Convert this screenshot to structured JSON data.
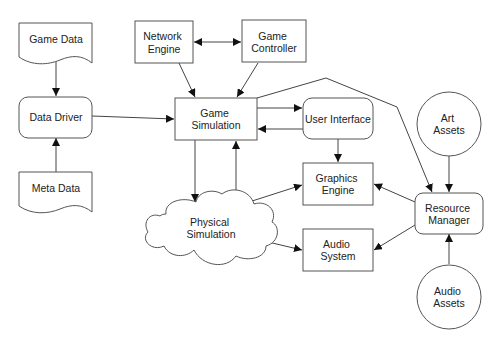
{
  "diagram": {
    "type": "game engine architecture flowchart",
    "nodes": {
      "game_data": {
        "label": [
          "Game Data"
        ],
        "shape": "document"
      },
      "data_driver": {
        "label": [
          "Data Driver"
        ],
        "shape": "rounded-rect"
      },
      "meta_data": {
        "label": [
          "Meta Data"
        ],
        "shape": "document"
      },
      "network_engine": {
        "label": [
          "Network",
          "Engine"
        ],
        "shape": "rect"
      },
      "game_controller": {
        "label": [
          "Game",
          "Controller"
        ],
        "shape": "rect"
      },
      "game_simulation": {
        "label": [
          "Game",
          "Simulation"
        ],
        "shape": "rect"
      },
      "user_interface": {
        "label": [
          "User Interface"
        ],
        "shape": "rounded-rect"
      },
      "graphics_engine": {
        "label": [
          "Graphics",
          "Engine"
        ],
        "shape": "rect"
      },
      "audio_system": {
        "label": [
          "Audio",
          "System"
        ],
        "shape": "rect"
      },
      "physical_simulation": {
        "label": [
          "Physical",
          "Simulation"
        ],
        "shape": "cloud"
      },
      "resource_manager": {
        "label": [
          "Resource",
          "Manager"
        ],
        "shape": "rounded-rect"
      },
      "art_assets": {
        "label": [
          "Art",
          "Assets"
        ],
        "shape": "circle"
      },
      "audio_assets": {
        "label": [
          "Audio",
          "Assets"
        ],
        "shape": "circle"
      }
    },
    "edges": [
      {
        "from": "Game Data",
        "to": "Data Driver"
      },
      {
        "from": "Meta Data",
        "to": "Data Driver"
      },
      {
        "from": "Data Driver",
        "to": "Game Simulation"
      },
      {
        "from": "Network Engine",
        "to": "Game Controller",
        "bidirectional": true
      },
      {
        "from": "Network Engine",
        "to": "Game Simulation"
      },
      {
        "from": "Game Controller",
        "to": "Game Simulation"
      },
      {
        "from": "Game Simulation",
        "to": "User Interface"
      },
      {
        "from": "User Interface",
        "to": "Game Simulation"
      },
      {
        "from": "User Interface",
        "to": "Graphics Engine"
      },
      {
        "from": "Game Simulation",
        "to": "Physical Simulation"
      },
      {
        "from": "Physical Simulation",
        "to": "Game Simulation"
      },
      {
        "from": "Physical Simulation",
        "to": "Graphics Engine"
      },
      {
        "from": "Physical Simulation",
        "to": "Audio System"
      },
      {
        "from": "Game Simulation",
        "to": "Resource Manager"
      },
      {
        "from": "Art Assets",
        "to": "Resource Manager"
      },
      {
        "from": "Audio Assets",
        "to": "Resource Manager"
      },
      {
        "from": "Resource Manager",
        "to": "Graphics Engine"
      },
      {
        "from": "Resource Manager",
        "to": "Audio System"
      }
    ]
  }
}
